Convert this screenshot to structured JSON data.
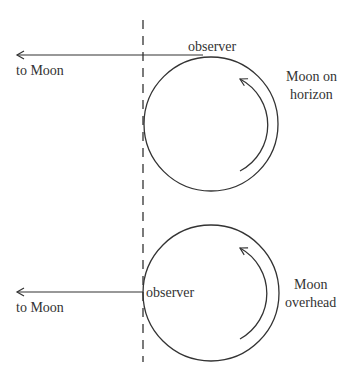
{
  "diagram": {
    "line_color": "#333333",
    "top_panel": {
      "observer_label": "observer",
      "direction_label": "to Moon",
      "caption_line1": "Moon on",
      "caption_line2": "horizon"
    },
    "bottom_panel": {
      "observer_label": "observer",
      "direction_label": "to Moon",
      "caption_line1": "Moon",
      "caption_line2": "overhead"
    },
    "rotation_direction": "counterclockwise"
  }
}
